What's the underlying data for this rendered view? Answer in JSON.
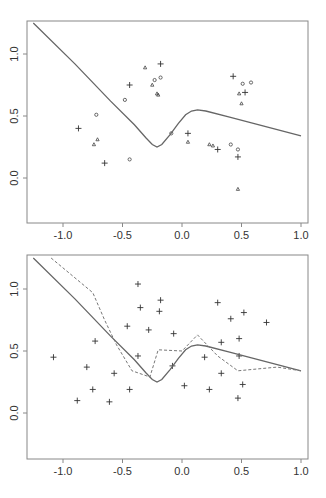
{
  "chart_data": [
    {
      "type": "scatter",
      "title": "",
      "xlabel": "",
      "ylabel": "",
      "xlim": [
        -1.3,
        1.05
      ],
      "ylim": [
        -0.37,
        1.28
      ],
      "grid": false,
      "xticks": [
        -1.0,
        -0.5,
        0.0,
        0.5,
        1.0
      ],
      "xtick_labels": [
        "-1.0",
        "-0.5",
        "0.0",
        "0.5",
        "1.0"
      ],
      "yticks": [
        0.0,
        0.5,
        1.0
      ],
      "ytick_labels": [
        "0.0",
        "0.5",
        "1.0"
      ],
      "series": [
        {
          "name": "plus",
          "marker": "+",
          "points": [
            [
              -0.87,
              0.4
            ],
            [
              -0.65,
              0.12
            ],
            [
              -0.44,
              0.75
            ],
            [
              -0.18,
              0.92
            ],
            [
              0.05,
              0.36
            ],
            [
              0.3,
              0.23
            ],
            [
              0.47,
              0.17
            ],
            [
              0.43,
              0.82
            ],
            [
              0.53,
              0.69
            ]
          ]
        },
        {
          "name": "circle",
          "marker": "o",
          "points": [
            [
              -0.72,
              0.51
            ],
            [
              -0.44,
              0.15
            ],
            [
              -0.48,
              0.63
            ],
            [
              -0.23,
              0.79
            ],
            [
              -0.18,
              0.81
            ],
            [
              -0.09,
              0.36
            ],
            [
              0.41,
              0.27
            ],
            [
              0.47,
              0.23
            ],
            [
              0.51,
              0.76
            ],
            [
              0.58,
              0.77
            ]
          ]
        },
        {
          "name": "triangle",
          "marker": "triangle",
          "points": [
            [
              -0.71,
              0.31
            ],
            [
              -0.74,
              0.27
            ],
            [
              -0.31,
              0.89
            ],
            [
              -0.25,
              0.75
            ],
            [
              -0.21,
              0.68
            ],
            [
              -0.2,
              0.67
            ],
            [
              0.05,
              0.29
            ],
            [
              0.23,
              0.27
            ],
            [
              0.26,
              0.26
            ],
            [
              0.48,
              0.68
            ],
            [
              0.5,
              0.6
            ],
            [
              0.47,
              -0.09
            ]
          ]
        },
        {
          "name": "fitted-curve",
          "style": "solid",
          "points": [
            [
              -1.25,
              1.25
            ],
            [
              -0.9,
              0.92
            ],
            [
              -0.6,
              0.62
            ],
            [
              -0.4,
              0.43
            ],
            [
              -0.3,
              0.32
            ],
            [
              -0.25,
              0.27
            ],
            [
              -0.21,
              0.25
            ],
            [
              -0.17,
              0.27
            ],
            [
              -0.1,
              0.35
            ],
            [
              -0.03,
              0.44
            ],
            [
              0.03,
              0.51
            ],
            [
              0.08,
              0.54
            ],
            [
              0.13,
              0.55
            ],
            [
              0.2,
              0.54
            ],
            [
              0.4,
              0.49
            ],
            [
              0.6,
              0.44
            ],
            [
              0.8,
              0.39
            ],
            [
              1.0,
              0.34
            ]
          ]
        }
      ]
    },
    {
      "type": "scatter",
      "title": "",
      "xlabel": "",
      "ylabel": "",
      "xlim": [
        -1.3,
        1.05
      ],
      "ylim": [
        -0.37,
        1.28
      ],
      "grid": false,
      "xticks": [
        -1.0,
        -0.5,
        0.0,
        0.5,
        1.0
      ],
      "xtick_labels": [
        "-1.0",
        "-0.5",
        "0.0",
        "0.5",
        "1.0"
      ],
      "yticks": [
        0.0,
        0.5,
        1.0
      ],
      "ytick_labels": [
        "0.0",
        "0.5",
        "1.0"
      ],
      "series": [
        {
          "name": "plus",
          "marker": "+",
          "points": [
            [
              -1.08,
              0.45
            ],
            [
              -0.88,
              0.1
            ],
            [
              -0.8,
              0.37
            ],
            [
              -0.73,
              0.58
            ],
            [
              -0.75,
              0.19
            ],
            [
              -0.61,
              0.09
            ],
            [
              -0.57,
              0.32
            ],
            [
              -0.46,
              0.7
            ],
            [
              -0.44,
              0.19
            ],
            [
              -0.37,
              1.04
            ],
            [
              -0.35,
              0.85
            ],
            [
              -0.37,
              0.46
            ],
            [
              -0.28,
              0.67
            ],
            [
              -0.18,
              0.91
            ],
            [
              -0.19,
              0.82
            ],
            [
              -0.07,
              0.64
            ],
            [
              -0.08,
              0.38
            ],
            [
              0.02,
              0.22
            ],
            [
              0.19,
              0.45
            ],
            [
              0.23,
              0.19
            ],
            [
              0.3,
              0.89
            ],
            [
              0.33,
              0.57
            ],
            [
              0.33,
              0.32
            ],
            [
              0.41,
              0.76
            ],
            [
              0.48,
              0.6
            ],
            [
              0.48,
              0.46
            ],
            [
              0.52,
              0.81
            ],
            [
              0.47,
              0.12
            ],
            [
              0.51,
              0.23
            ],
            [
              0.71,
              0.73
            ]
          ]
        },
        {
          "name": "fitted-curve",
          "style": "solid",
          "points": [
            [
              -1.25,
              1.25
            ],
            [
              -0.9,
              0.92
            ],
            [
              -0.6,
              0.62
            ],
            [
              -0.4,
              0.43
            ],
            [
              -0.3,
              0.32
            ],
            [
              -0.25,
              0.27
            ],
            [
              -0.21,
              0.25
            ],
            [
              -0.17,
              0.27
            ],
            [
              -0.1,
              0.35
            ],
            [
              -0.03,
              0.44
            ],
            [
              0.03,
              0.51
            ],
            [
              0.08,
              0.54
            ],
            [
              0.13,
              0.55
            ],
            [
              0.2,
              0.54
            ],
            [
              0.4,
              0.49
            ],
            [
              0.6,
              0.44
            ],
            [
              0.8,
              0.39
            ],
            [
              1.0,
              0.34
            ]
          ]
        },
        {
          "name": "dashed-curve",
          "style": "dashed",
          "points": [
            [
              -1.1,
              1.25
            ],
            [
              -0.75,
              0.97
            ],
            [
              -0.65,
              0.75
            ],
            [
              -0.55,
              0.55
            ],
            [
              -0.42,
              0.34
            ],
            [
              -0.27,
              0.29
            ],
            [
              -0.2,
              0.51
            ],
            [
              0.0,
              0.5
            ],
            [
              0.13,
              0.63
            ],
            [
              0.3,
              0.46
            ],
            [
              0.47,
              0.34
            ],
            [
              0.8,
              0.37
            ],
            [
              1.0,
              0.34
            ]
          ]
        }
      ]
    }
  ]
}
